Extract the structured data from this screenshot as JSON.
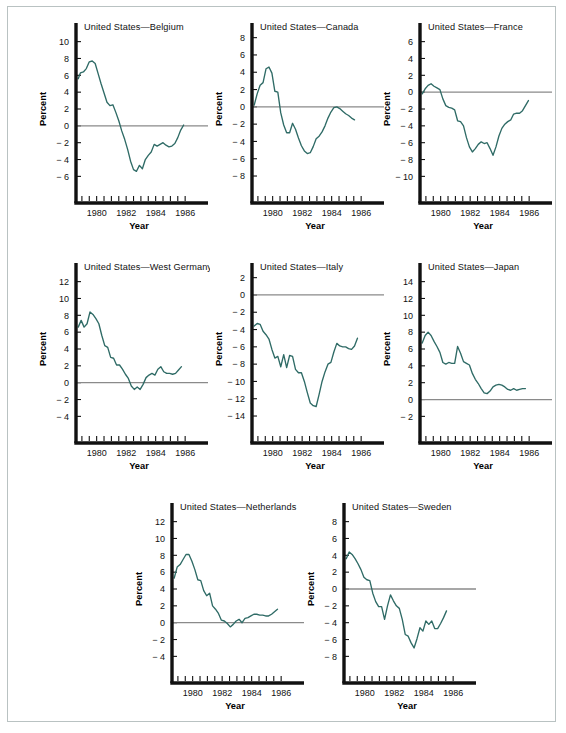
{
  "figure": {
    "background": "#ffffff",
    "frame_color": "#b9c2c2",
    "line_color": "#2f6b66",
    "axis_color": "#111111",
    "zero_line_color": "#8a8a8a"
  },
  "common": {
    "xlabel": "Year",
    "ylabel": "Percent",
    "x_tick_labels": [
      "1980",
      "1982",
      "1984",
      "1986"
    ],
    "x_tick_values": [
      1980,
      1982,
      1984,
      1986
    ],
    "xlim": [
      1978.6,
      1986.6
    ],
    "x_minor_step": 0.5
  },
  "chart_data": [
    {
      "type": "line",
      "title": "United States—Belgium",
      "xlabel": "Year",
      "ylabel": "Percent",
      "ylim": [
        -7.5,
        11.5
      ],
      "y_ticks": [
        10,
        8,
        6,
        4,
        2,
        0,
        -2,
        -4,
        -6
      ],
      "y_tick_labels": [
        "10",
        "8",
        "6",
        "4",
        "2",
        "0",
        "− 2",
        "− 4",
        "− 6"
      ],
      "grid": false,
      "legend": "none",
      "x": [
        1978.75,
        1978.9,
        1979.1,
        1979.3,
        1979.5,
        1979.7,
        1979.9,
        1980.1,
        1980.3,
        1980.5,
        1980.7,
        1980.9,
        1981.1,
        1981.3,
        1981.5,
        1981.7,
        1981.9,
        1982.1,
        1982.3,
        1982.5,
        1982.7,
        1982.9,
        1983.1,
        1983.3,
        1983.5,
        1983.7,
        1983.9,
        1984.1,
        1984.3,
        1984.5,
        1984.7,
        1984.9,
        1985.1,
        1985.3,
        1985.5,
        1985.7,
        1985.9
      ],
      "y": [
        5.6,
        6.3,
        6.4,
        6.8,
        7.6,
        7.7,
        7.4,
        6.2,
        5.0,
        3.9,
        2.8,
        2.4,
        2.5,
        1.6,
        0.6,
        -0.6,
        -1.6,
        -2.8,
        -4.2,
        -5.2,
        -5.4,
        -4.7,
        -5.1,
        -4.0,
        -3.5,
        -3.1,
        -2.2,
        -2.4,
        -2.2,
        -2.0,
        -2.3,
        -2.5,
        -2.4,
        -2.1,
        -1.4,
        -0.5,
        0.1
      ]
    },
    {
      "type": "line",
      "title": "United States—Canada",
      "xlabel": "Year",
      "ylabel": "Percent",
      "ylim": [
        -9.5,
        9.0
      ],
      "y_ticks": [
        8,
        6,
        4,
        2,
        0,
        -2,
        -4,
        -6,
        -8
      ],
      "y_tick_labels": [
        "8",
        "6",
        "4",
        "2",
        "0",
        "− 2",
        "− 4",
        "− 6",
        "− 8"
      ],
      "grid": false,
      "legend": "none",
      "x": [
        1978.75,
        1978.95,
        1979.15,
        1979.35,
        1979.55,
        1979.75,
        1979.95,
        1980.15,
        1980.35,
        1980.55,
        1980.75,
        1980.95,
        1981.15,
        1981.35,
        1981.55,
        1981.75,
        1981.95,
        1982.15,
        1982.35,
        1982.55,
        1982.75,
        1982.95,
        1983.15,
        1983.35,
        1983.55,
        1983.75,
        1983.95,
        1984.15,
        1984.35,
        1984.55,
        1984.75,
        1984.95,
        1985.15,
        1985.35,
        1985.55
      ],
      "y": [
        0.2,
        1.5,
        2.5,
        2.8,
        4.4,
        4.6,
        3.9,
        1.8,
        1.7,
        -0.7,
        -2.1,
        -3.0,
        -3.0,
        -1.9,
        -2.6,
        -3.6,
        -4.5,
        -5.1,
        -5.4,
        -5.3,
        -4.6,
        -3.7,
        -3.4,
        -2.9,
        -2.2,
        -1.3,
        -0.6,
        -0.1,
        0.0,
        -0.2,
        -0.5,
        -0.8,
        -1.0,
        -1.3,
        -1.5
      ]
    },
    {
      "type": "line",
      "title": "United States—France",
      "xlabel": "Year",
      "ylabel": "Percent",
      "ylim": [
        -11.5,
        7.5
      ],
      "y_ticks": [
        6,
        4,
        2,
        0,
        -2,
        -4,
        -6,
        -8,
        -10
      ],
      "y_tick_labels": [
        "6",
        "4",
        "2",
        "0",
        "− 2",
        "− 4",
        "− 6",
        "− 8",
        "− 10"
      ],
      "grid": false,
      "legend": "none",
      "x": [
        1978.75,
        1978.95,
        1979.15,
        1979.35,
        1979.55,
        1979.75,
        1979.95,
        1980.15,
        1980.35,
        1980.55,
        1980.75,
        1980.95,
        1981.15,
        1981.35,
        1981.55,
        1981.75,
        1981.95,
        1982.15,
        1982.35,
        1982.55,
        1982.75,
        1982.95,
        1983.15,
        1983.35,
        1983.55,
        1983.75,
        1983.95,
        1984.15,
        1984.35,
        1984.55,
        1984.75,
        1984.95,
        1985.15,
        1985.35,
        1985.55,
        1985.75,
        1985.95
      ],
      "y": [
        -0.2,
        0.4,
        0.8,
        1.0,
        0.7,
        0.5,
        0.3,
        -0.8,
        -1.6,
        -1.8,
        -1.9,
        -2.1,
        -3.4,
        -3.5,
        -4.0,
        -5.4,
        -6.5,
        -7.1,
        -6.7,
        -6.2,
        -5.9,
        -6.1,
        -6.0,
        -6.7,
        -7.5,
        -6.5,
        -5.2,
        -4.3,
        -3.8,
        -3.5,
        -3.3,
        -2.6,
        -2.5,
        -2.5,
        -2.2,
        -1.6,
        -1.0
      ]
    },
    {
      "type": "line",
      "title": "United States—West Germany",
      "xlabel": "Year",
      "ylabel": "Percent",
      "ylim": [
        -5.5,
        13.5
      ],
      "y_ticks": [
        12,
        10,
        8,
        6,
        4,
        2,
        0,
        -2,
        -4
      ],
      "y_tick_labels": [
        "12",
        "10",
        "8",
        "6",
        "4",
        "2",
        "0",
        "− 2",
        "− 4"
      ],
      "grid": false,
      "legend": "none",
      "x": [
        1978.75,
        1978.95,
        1979.15,
        1979.35,
        1979.55,
        1979.75,
        1979.95,
        1980.15,
        1980.35,
        1980.55,
        1980.75,
        1980.95,
        1981.15,
        1981.35,
        1981.55,
        1981.75,
        1981.95,
        1982.15,
        1982.35,
        1982.55,
        1982.75,
        1982.95,
        1983.15,
        1983.35,
        1983.55,
        1983.75,
        1983.95,
        1984.15,
        1984.35,
        1984.55,
        1984.75,
        1984.95,
        1985.15,
        1985.35,
        1985.55,
        1985.75
      ],
      "y": [
        6.6,
        7.4,
        6.6,
        7.0,
        8.4,
        8.1,
        7.6,
        7.0,
        5.6,
        4.4,
        4.2,
        3.0,
        2.9,
        2.1,
        2.1,
        1.6,
        1.0,
        0.5,
        -0.4,
        -0.8,
        -0.5,
        -0.8,
        -0.2,
        0.6,
        0.9,
        1.1,
        0.9,
        1.6,
        1.9,
        1.3,
        1.1,
        1.1,
        1.0,
        1.1,
        1.5,
        1.9
      ]
    },
    {
      "type": "line",
      "title": "United States—Italy",
      "xlabel": "Year",
      "ylabel": "Percent",
      "ylim": [
        -15.5,
        3.0
      ],
      "y_ticks": [
        2,
        0,
        -2,
        -4,
        -6,
        -8,
        -10,
        -12,
        -14
      ],
      "y_tick_labels": [
        "2",
        "0",
        "− 2",
        "− 4",
        "− 6",
        "− 8",
        "− 10",
        "− 12",
        "− 14"
      ],
      "grid": false,
      "legend": "none",
      "x": [
        1978.75,
        1978.95,
        1979.15,
        1979.35,
        1979.55,
        1979.75,
        1979.95,
        1980.15,
        1980.35,
        1980.55,
        1980.75,
        1980.95,
        1981.15,
        1981.35,
        1981.55,
        1981.75,
        1981.95,
        1982.15,
        1982.35,
        1982.55,
        1982.75,
        1982.95,
        1983.15,
        1983.35,
        1983.55,
        1983.75,
        1983.95,
        1984.15,
        1984.35,
        1984.55,
        1984.75,
        1984.95,
        1985.15,
        1985.35,
        1985.55,
        1985.75
      ],
      "y": [
        -3.6,
        -3.3,
        -3.4,
        -4.2,
        -4.6,
        -5.1,
        -6.3,
        -7.3,
        -7.1,
        -8.3,
        -6.9,
        -8.4,
        -7.0,
        -7.1,
        -8.6,
        -9.0,
        -9.0,
        -10.0,
        -11.3,
        -12.5,
        -12.8,
        -12.9,
        -11.5,
        -10.0,
        -8.9,
        -8.0,
        -7.8,
        -6.6,
        -5.6,
        -5.9,
        -6.0,
        -6.0,
        -6.2,
        -6.3,
        -5.9,
        -5.0
      ]
    },
    {
      "type": "line",
      "title": "United States—Japan",
      "xlabel": "Year",
      "ylabel": "Percent",
      "ylim": [
        -3.5,
        15.5
      ],
      "y_ticks": [
        14,
        12,
        10,
        8,
        6,
        4,
        2,
        0,
        -2
      ],
      "y_tick_labels": [
        "14",
        "12",
        "10",
        "8",
        "6",
        "4",
        "2",
        "0",
        "− 2"
      ],
      "grid": false,
      "legend": "none",
      "x": [
        1978.75,
        1978.95,
        1979.15,
        1979.35,
        1979.55,
        1979.75,
        1979.95,
        1980.15,
        1980.35,
        1980.55,
        1980.75,
        1980.95,
        1981.15,
        1981.35,
        1981.55,
        1981.75,
        1981.95,
        1982.15,
        1982.35,
        1982.55,
        1982.75,
        1982.95,
        1983.15,
        1983.35,
        1983.55,
        1983.75,
        1983.95,
        1984.15,
        1984.35,
        1984.55,
        1984.75,
        1984.95,
        1985.15,
        1985.35,
        1985.55,
        1985.75
      ],
      "y": [
        6.7,
        7.6,
        8.0,
        7.6,
        6.9,
        6.3,
        5.6,
        4.4,
        4.2,
        4.4,
        4.3,
        4.3,
        6.3,
        5.5,
        4.5,
        4.3,
        4.1,
        3.1,
        2.4,
        1.9,
        1.3,
        0.8,
        0.7,
        1.0,
        1.5,
        1.7,
        1.8,
        1.7,
        1.5,
        1.2,
        1.1,
        1.3,
        1.1,
        1.2,
        1.3,
        1.3
      ]
    },
    {
      "type": "line",
      "title": "United States—Netherlands",
      "xlabel": "Year",
      "ylabel": "Percent",
      "ylim": [
        -5.5,
        13.5
      ],
      "y_ticks": [
        12,
        10,
        8,
        6,
        4,
        2,
        0,
        -2,
        -4
      ],
      "y_tick_labels": [
        "12",
        "10",
        "8",
        "6",
        "4",
        "2",
        "0",
        "− 2",
        "− 4"
      ],
      "grid": false,
      "legend": "none",
      "x": [
        1978.75,
        1978.95,
        1979.15,
        1979.35,
        1979.55,
        1979.75,
        1979.95,
        1980.15,
        1980.35,
        1980.55,
        1980.75,
        1980.95,
        1981.15,
        1981.35,
        1981.55,
        1981.75,
        1981.95,
        1982.15,
        1982.35,
        1982.55,
        1982.75,
        1982.95,
        1983.15,
        1983.35,
        1983.55,
        1983.75,
        1983.95,
        1984.15,
        1984.35,
        1984.55,
        1984.75,
        1984.95,
        1985.15,
        1985.35,
        1985.55,
        1985.75
      ],
      "y": [
        5.3,
        6.6,
        6.9,
        7.5,
        8.1,
        8.1,
        7.3,
        6.3,
        5.1,
        5.0,
        3.8,
        3.2,
        3.5,
        2.0,
        1.6,
        1.1,
        0.3,
        0.2,
        -0.1,
        -0.5,
        -0.2,
        0.2,
        0.4,
        0.0,
        0.5,
        0.6,
        0.8,
        1.0,
        1.0,
        0.9,
        0.9,
        0.8,
        0.8,
        1.0,
        1.3,
        1.6
      ]
    },
    {
      "type": "line",
      "title": "United States—Sweden",
      "xlabel": "Year",
      "ylabel": "Percent",
      "ylim": [
        -9.5,
        9.5
      ],
      "y_ticks": [
        8,
        6,
        4,
        2,
        0,
        -2,
        -4,
        -6,
        -8
      ],
      "y_tick_labels": [
        "8",
        "6",
        "4",
        "2",
        "0",
        "− 2",
        "− 4",
        "− 6",
        "− 8"
      ],
      "grid": false,
      "legend": "none",
      "x": [
        1978.75,
        1978.95,
        1979.15,
        1979.35,
        1979.55,
        1979.75,
        1979.95,
        1980.15,
        1980.35,
        1980.55,
        1980.75,
        1980.95,
        1981.15,
        1981.35,
        1981.55,
        1981.75,
        1981.95,
        1982.15,
        1982.35,
        1982.55,
        1982.75,
        1982.95,
        1983.15,
        1983.35,
        1983.55,
        1983.75,
        1983.95,
        1984.15,
        1984.35,
        1984.55,
        1984.75,
        1984.95,
        1985.15,
        1985.35,
        1985.55
      ],
      "y": [
        3.6,
        4.4,
        4.1,
        3.6,
        3.0,
        2.3,
        1.4,
        1.1,
        1.0,
        -0.5,
        -1.5,
        -2.1,
        -2.1,
        -3.6,
        -2.0,
        -0.7,
        -1.4,
        -2.0,
        -2.3,
        -3.6,
        -5.4,
        -5.6,
        -6.4,
        -7.0,
        -5.9,
        -4.6,
        -5.0,
        -3.8,
        -4.2,
        -3.8,
        -4.7,
        -4.7,
        -4.1,
        -3.4,
        -2.6
      ]
    }
  ]
}
